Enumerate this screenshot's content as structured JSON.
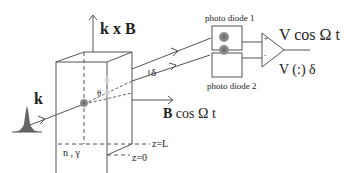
{
  "labels": {
    "kxB": "k x B",
    "k": "k",
    "theta": "θ",
    "delta": "δ",
    "bcos": "B cos Ω t",
    "pd1": "photo diode 1",
    "pd2": "photo diode 2",
    "vcos": "V cos Ω t",
    "vdelta": "V (:) δ",
    "ngamma": "n , γ",
    "zL": "z=L",
    "z0": "z=0",
    "plus": "+",
    "minus": "-"
  },
  "colors": {
    "line": "#555555",
    "spot": "#777777",
    "spot_light": "#cccccc",
    "text": "#222222"
  }
}
